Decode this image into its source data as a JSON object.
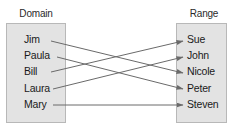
{
  "diagram": {
    "type": "mapping",
    "domain": {
      "label": "Domain",
      "items": [
        "Jim",
        "Paula",
        "Bill",
        "Laura",
        "Mary"
      ]
    },
    "range": {
      "label": "Range",
      "items": [
        "Sue",
        "John",
        "Nicole",
        "Peter",
        "Steven"
      ]
    },
    "mappings": [
      {
        "from": "Jim",
        "to": "Nicole"
      },
      {
        "from": "Paula",
        "to": "Peter"
      },
      {
        "from": "Bill",
        "to": "Sue"
      },
      {
        "from": "Laura",
        "to": "John"
      },
      {
        "from": "Mary",
        "to": "Steven"
      }
    ],
    "colors": {
      "box_fill": "#e3e3e3",
      "box_border": "#b8b8b8",
      "arrow": "#6a6a6a",
      "text": "#1a1a1a"
    }
  }
}
